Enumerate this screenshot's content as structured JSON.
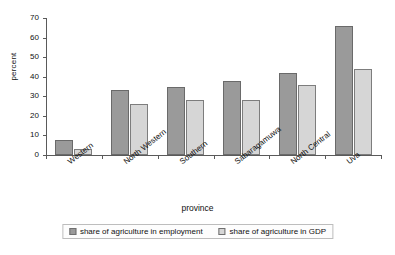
{
  "chart_data": {
    "type": "bar",
    "title": "",
    "xlabel": "province",
    "ylabel": "percent",
    "ylim": [
      0,
      70
    ],
    "ytick_step": 10,
    "yticks": [
      0,
      10,
      20,
      30,
      40,
      50,
      60,
      70
    ],
    "grid": false,
    "legend_position": "bottom",
    "categories": [
      "Western",
      "North Western",
      "Southern",
      "Sabaragamuwa",
      "North Central",
      "Uva"
    ],
    "series": [
      {
        "name": "share of agriculture in employment",
        "color": "#9a9a9a",
        "values": [
          7.5,
          33,
          35,
          38,
          42,
          66
        ]
      },
      {
        "name": "share of agriculture in GDP",
        "color": "#d6d6d6",
        "values": [
          3,
          26,
          28,
          28,
          36,
          44
        ]
      }
    ]
  }
}
